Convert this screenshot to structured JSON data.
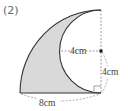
{
  "problem": {
    "number_label": "(2)"
  },
  "figure": {
    "shape_fill": "#d9d9d9",
    "stroke_color": "#333333",
    "dash_color": "#777777",
    "labels": {
      "inner_radius": "4cm",
      "vertical_radius": "4cm",
      "base_length": "8cm"
    },
    "dimensions": {
      "big_radius_cm": 8,
      "small_radius_cm": 4
    }
  }
}
